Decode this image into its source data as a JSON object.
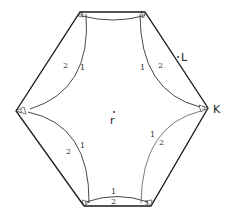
{
  "diagram": {
    "title": "",
    "labels": {
      "L": "L",
      "K": "K",
      "center": "r"
    },
    "arc_labels": {
      "upper_left_outer": "2",
      "upper_left_inner": "1",
      "upper_right_inner": "1",
      "upper_right_outer": "2",
      "lower_left_outer": "2",
      "lower_left_inner": "1",
      "lower_right_inner": "1",
      "lower_right_outer": "2",
      "bottom_inner": "1",
      "bottom_outer": "2"
    },
    "corner_labels": {
      "top_left": "3",
      "top_right": "3",
      "right": "3",
      "left": "3",
      "bottom_left": "1",
      "bottom_right": "3"
    }
  }
}
